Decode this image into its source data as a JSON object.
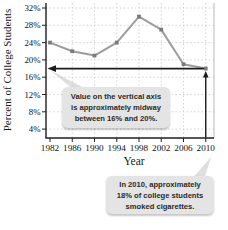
{
  "chart_data": {
    "type": "line",
    "title": "",
    "xlabel": "Year",
    "ylabel": "Percent of College Students",
    "x": [
      1982,
      1986,
      1990,
      1994,
      1998,
      2002,
      2006,
      2010
    ],
    "series": [
      {
        "name": "college students who smoked cigarettes",
        "values": [
          24,
          22,
          21,
          24,
          30,
          27,
          19,
          18
        ]
      }
    ],
    "xticks": [
      "1982",
      "1986",
      "1990",
      "1994",
      "1998",
      "2002",
      "2006",
      "2010"
    ],
    "yticks": [
      "4%",
      "8%",
      "12%",
      "16%",
      "20%",
      "24%",
      "28%",
      "32%"
    ],
    "ytick_values": [
      4,
      8,
      12,
      16,
      20,
      24,
      28,
      32
    ],
    "ylim": [
      2,
      33
    ],
    "xlim": [
      1982,
      2010
    ],
    "grid": true,
    "legend": false,
    "annotations": {
      "highlight_year": 2010,
      "highlight_value_percent": 18,
      "horizontal_arrow": "from 2010 data point left to vertical axis at 18%",
      "vertical_arrow": "from horizontal axis at 2010 up to data point"
    }
  },
  "callout_axis": {
    "lines": [
      "Value on the vertical axis",
      "is approximately midway",
      "between 16% and 20%."
    ]
  },
  "callout_2010": {
    "lines": [
      "In 2010, approximately",
      "18% of college students",
      "smoked cigarettes."
    ]
  },
  "colors": {
    "series_line": "#9c9c9c",
    "marker": "#7a7a7a",
    "axis": "#1f1f1f",
    "grid": "#c9c9c9",
    "right_border": "#bbbbbb",
    "arrow": "#1c1c1c",
    "callout_bg": "#e4e4e4",
    "callout_pointer": "#dedede",
    "callout_text": "#2a2a2a",
    "tick_label": "#111111"
  }
}
